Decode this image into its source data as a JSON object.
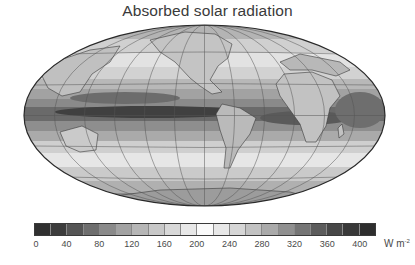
{
  "title": "Absorbed solar radiation",
  "map": {
    "projection": "Mollweide (elliptical)",
    "center_longitude": "Pacific-centered (~-150°)",
    "graticule_spacing_deg": 30,
    "ellipse": {
      "cx": 204.5,
      "cy": 115.5,
      "rx": 180.5,
      "ry": 90.5
    },
    "features": [
      "dark equatorial band of high absorption across Pacific",
      "light subtropical bands",
      "dark bright-ring at high latitudes near poles lighter",
      "continents outlined: Asia, Australia, North America, South America, Africa, Europe, Antarctica"
    ]
  },
  "colorbar": {
    "min": 0,
    "max": 420,
    "step": 20,
    "segment_colors": [
      "#303030",
      "#3c3c3c",
      "#555555",
      "#6e6e6e",
      "#8a8a8a",
      "#a2a2a2",
      "#b6b6b6",
      "#c8c8c8",
      "#d8d8d8",
      "#e8e8e8",
      "#fafafa",
      "#e8e8e8",
      "#d6d6d6",
      "#c2c2c2",
      "#aaaaaa",
      "#909090",
      "#757575",
      "#5c5c5c",
      "#474747",
      "#383838",
      "#2e2e2e"
    ],
    "tick_labels": [
      "0",
      "40",
      "80",
      "120",
      "160",
      "200",
      "240",
      "280",
      "320",
      "360",
      "400"
    ],
    "units": "W m",
    "units_exponent": "-2"
  },
  "chart_data": {
    "type": "heatmap",
    "title": "Absorbed solar radiation",
    "colorbar_label": "W m-2",
    "colorbar_ticks": [
      0,
      40,
      80,
      120,
      160,
      200,
      240,
      280,
      320,
      360,
      400
    ],
    "range": [
      0,
      420
    ]
  }
}
